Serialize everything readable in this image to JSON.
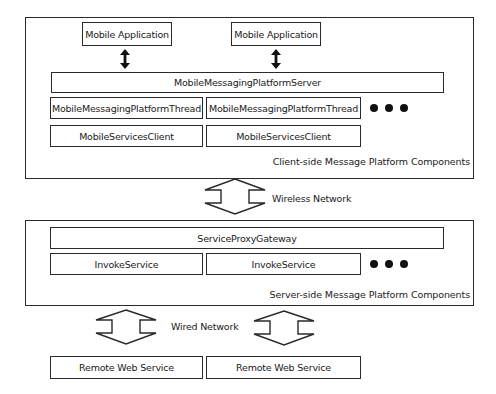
{
  "diagram": {
    "client_side": {
      "label": "Client-side Message Platform Components",
      "mobile_apps": [
        {
          "label": "Mobile Application"
        },
        {
          "label": "Mobile Application"
        }
      ],
      "server": {
        "label": "MobileMessagingPlatformServer"
      },
      "threads": [
        {
          "label": "MobileMessagingPlatformThread"
        },
        {
          "label": "MobileMessagingPlatformThread"
        }
      ],
      "clients": [
        {
          "label": "MobileServicesClient"
        },
        {
          "label": "MobileServicesClient"
        }
      ],
      "more_indicator": "ellipsis-dots"
    },
    "wireless_network": {
      "label": "Wireless Network",
      "icon": "double-headed-block-arrow"
    },
    "server_side": {
      "label": "Server-side Message Platform Components",
      "gateway": {
        "label": "ServiceProxyGateway"
      },
      "invoke_services": [
        {
          "label": "InvokeService"
        },
        {
          "label": "InvokeService"
        }
      ],
      "more_indicator": "ellipsis-dots"
    },
    "wired_network": {
      "label": "Wired Network",
      "icon": "double-headed-block-arrow"
    },
    "remote_services": [
      {
        "label": "Remote Web Service"
      },
      {
        "label": "Remote Web Service"
      }
    ],
    "colors": {
      "stroke": "#2a2a2a",
      "background": "#ffffff",
      "text": "#1a1a1a"
    }
  }
}
